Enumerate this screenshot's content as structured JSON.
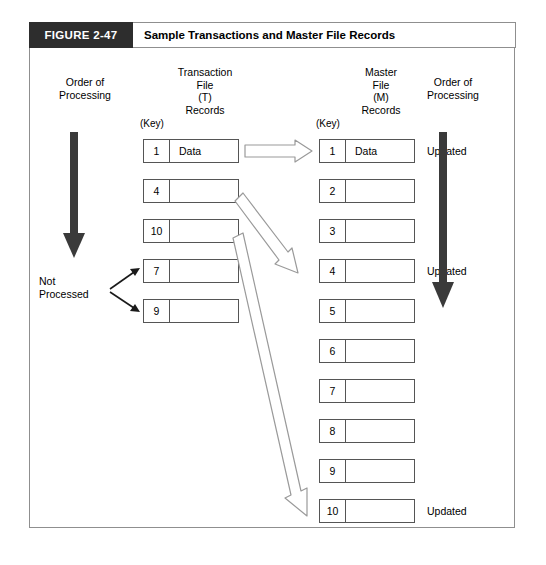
{
  "figure": {
    "number": "FIGURE 2-47",
    "title": "Sample Transactions and Master File Records",
    "band_color": "#2d2d2d",
    "border_color": "#8f8f8f"
  },
  "left_panel": {
    "order_label": "Order of\nProcessing",
    "arrow_icon": "down-arrow-thick",
    "arrow_color": "#3a3a3a"
  },
  "right_panel": {
    "order_label": "Order of\nProcessing",
    "arrow_icon": "down-arrow-thick",
    "arrow_color": "#3a3a3a"
  },
  "not_processed": {
    "label": "Not\nProcessed",
    "arrow_icon": "thin-arrow",
    "targets": [
      7,
      9
    ]
  },
  "transaction_file": {
    "heading": "Transaction\nFile\n(T)\nRecords",
    "key_label": "(Key)",
    "records": [
      {
        "key": "1",
        "data": "Data"
      },
      {
        "key": "4",
        "data": ""
      },
      {
        "key": "10",
        "data": ""
      },
      {
        "key": "7",
        "data": ""
      },
      {
        "key": "9",
        "data": ""
      }
    ]
  },
  "master_file": {
    "heading": "Master\nFile\n(M)\nRecords",
    "key_label": "(Key)",
    "records": [
      {
        "key": "1",
        "data": "Data",
        "status": "Updated"
      },
      {
        "key": "2",
        "data": "",
        "status": ""
      },
      {
        "key": "3",
        "data": "",
        "status": ""
      },
      {
        "key": "4",
        "data": "",
        "status": "Updated"
      },
      {
        "key": "5",
        "data": "",
        "status": ""
      },
      {
        "key": "6",
        "data": "",
        "status": ""
      },
      {
        "key": "7",
        "data": "",
        "status": ""
      },
      {
        "key": "8",
        "data": "",
        "status": ""
      },
      {
        "key": "9",
        "data": "",
        "status": ""
      },
      {
        "key": "10",
        "data": "",
        "status": "Updated"
      }
    ]
  },
  "match_arrows": {
    "icon": "hollow-arrow",
    "links": [
      {
        "from": "T1",
        "to": "M1"
      },
      {
        "from": "T4",
        "to": "M4"
      },
      {
        "from": "T10",
        "to": "M10"
      }
    ]
  }
}
